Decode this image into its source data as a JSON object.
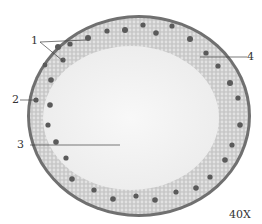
{
  "figure": {
    "magnification": "40X",
    "labels": [
      {
        "id": "1",
        "text": "1"
      },
      {
        "id": "2",
        "text": "2"
      },
      {
        "id": "3",
        "text": "3"
      },
      {
        "id": "4",
        "text": "4"
      }
    ],
    "colors": {
      "cortex": "#b8b8b8",
      "epidermis": "#6a6a6a",
      "pith": "#f4f4f4",
      "bundle": "#5a5a5a"
    }
  }
}
